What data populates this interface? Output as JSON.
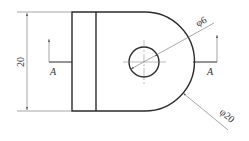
{
  "drawing": {
    "type": "engineering-orthographic-view",
    "dimensions": {
      "height": "20",
      "hole_diameter": "φ6",
      "arc_diameter": "φ20"
    },
    "section_labels": {
      "left": "A",
      "right": "A"
    },
    "colors": {
      "outline": "#2b2b2b",
      "dimension": "#6a6a6a",
      "background": "#ffffff"
    }
  }
}
